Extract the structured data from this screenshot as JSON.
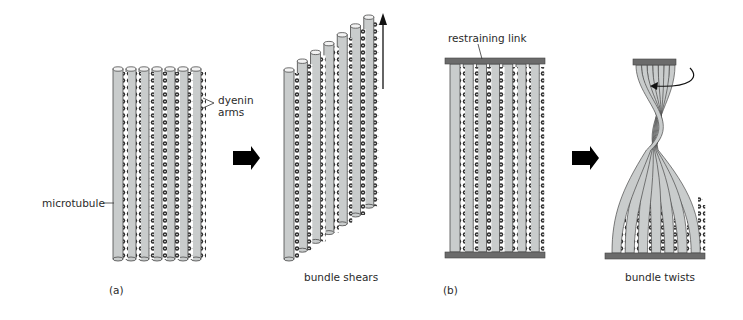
{
  "figure": {
    "panel_a": {
      "tag": "(a)",
      "labels": {
        "dynein_line1": "dyenin",
        "dynein_line2": "arms",
        "microtubule": "microtubule"
      },
      "caption": "bundle shears",
      "microtubule_count": 7
    },
    "panel_b": {
      "tag": "(b)",
      "labels": {
        "restraining_link": "restraining link"
      },
      "caption": "bundle twists",
      "microtubule_count": 7
    },
    "colors": {
      "tube_fill": "#c9cccc",
      "tube_stroke": "#4a4a4a",
      "tube_cap": "#f2f2f2",
      "dynein": "#2b2b2b",
      "link_bar": "#6b6b6b",
      "arrow": "#000000"
    }
  }
}
